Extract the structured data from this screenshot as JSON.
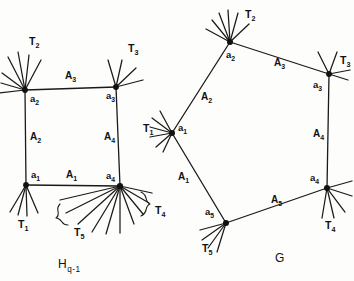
{
  "figure": {
    "caption_left": {
      "base": "H",
      "sub": "q-1"
    },
    "caption_right": {
      "base": "G",
      "sub": ""
    },
    "stroke_color": "#1a1a1a",
    "vertex_color": "#111111",
    "background": "#fdfdfc"
  },
  "graph_H": {
    "name": "H_q-1",
    "vertices": [
      {
        "id": "a1",
        "base": "a",
        "sub": "1",
        "x": 26,
        "y": 185,
        "label_x": 31,
        "label_y": 178
      },
      {
        "id": "a2",
        "base": "a",
        "sub": "2",
        "x": 25,
        "y": 90,
        "label_x": 30,
        "label_y": 102
      },
      {
        "id": "a3",
        "base": "a",
        "sub": "3",
        "x": 116,
        "y": 87,
        "label_x": 106,
        "label_y": 99
      },
      {
        "id": "a4",
        "base": "a",
        "sub": "4",
        "x": 120,
        "y": 186,
        "label_x": 108,
        "label_y": 179
      }
    ],
    "edges": [
      {
        "id": "A1",
        "base": "A",
        "sub": "1",
        "from": "a1",
        "to": "a4",
        "label_x": 66,
        "label_y": 178
      },
      {
        "id": "A2",
        "base": "A",
        "sub": "2",
        "from": "a1",
        "to": "a2",
        "label_x": 30,
        "label_y": 140
      },
      {
        "id": "A3",
        "base": "A",
        "sub": "3",
        "from": "a2",
        "to": "a3",
        "label_x": 65,
        "label_y": 79
      },
      {
        "id": "A4",
        "base": "A",
        "sub": "4",
        "from": "a3",
        "to": "a4",
        "label_x": 107,
        "label_y": 140
      }
    ],
    "trees": [
      {
        "id": "T1",
        "base": "T",
        "sub": "1",
        "at": "a1",
        "label_x": 21,
        "label_y": 228
      },
      {
        "id": "T2",
        "base": "T",
        "sub": "2",
        "at": "a2",
        "label_x": 30,
        "label_y": 45
      },
      {
        "id": "T3",
        "base": "T",
        "sub": "3",
        "at": "a3",
        "label_x": 129,
        "label_y": 52
      },
      {
        "id": "T4",
        "base": "T",
        "sub": "4",
        "at": "a4",
        "label_x": 155,
        "label_y": 214
      },
      {
        "id": "T5",
        "base": "T",
        "sub": "5",
        "at": "a4",
        "label_x": 78,
        "label_y": 234
      }
    ]
  },
  "graph_G": {
    "name": "G",
    "vertices": [
      {
        "id": "a1",
        "base": "a",
        "sub": "1",
        "x": 172,
        "y": 133,
        "label_x": 178,
        "label_y": 131
      },
      {
        "id": "a2",
        "base": "a",
        "sub": "2",
        "x": 230,
        "y": 42,
        "label_x": 226,
        "label_y": 57
      },
      {
        "id": "a3",
        "base": "a",
        "sub": "3",
        "x": 329,
        "y": 74,
        "label_x": 313,
        "label_y": 86
      },
      {
        "id": "a4",
        "base": "a",
        "sub": "4",
        "x": 327,
        "y": 188,
        "label_x": 310,
        "label_y": 182
      },
      {
        "id": "a5",
        "base": "a",
        "sub": "5",
        "x": 226,
        "y": 223,
        "label_x": 204,
        "label_y": 214
      }
    ],
    "edges": [
      {
        "id": "A1",
        "base": "A",
        "sub": "1",
        "from": "a1",
        "to": "a5",
        "label_x": 180,
        "label_y": 178
      },
      {
        "id": "A2",
        "base": "A",
        "sub": "2",
        "from": "a1",
        "to": "a2",
        "label_x": 203,
        "label_y": 98
      },
      {
        "id": "A3",
        "base": "A",
        "sub": "3",
        "from": "a2",
        "to": "a3",
        "label_x": 274,
        "label_y": 66
      },
      {
        "id": "A4",
        "base": "A",
        "sub": "4",
        "from": "a3",
        "to": "a4",
        "label_x": 313,
        "label_y": 136
      },
      {
        "id": "A5",
        "base": "A",
        "sub": "5",
        "from": "a5",
        "to": "a4",
        "label_x": 273,
        "label_y": 202
      }
    ],
    "trees": [
      {
        "id": "T1",
        "base": "T",
        "sub": "1",
        "at": "a1",
        "label_x": 146,
        "label_y": 131
      },
      {
        "id": "T2",
        "base": "T",
        "sub": "2",
        "at": "a2",
        "label_x": 247,
        "label_y": 17
      },
      {
        "id": "T3",
        "base": "T",
        "sub": "3",
        "at": "a3",
        "label_x": 341,
        "label_y": 64
      },
      {
        "id": "T4",
        "base": "T",
        "sub": "4",
        "at": "a4",
        "label_x": 328,
        "label_y": 228
      },
      {
        "id": "T5",
        "base": "T",
        "sub": "5",
        "at": "a5",
        "label_x": 205,
        "label_y": 250
      }
    ]
  }
}
